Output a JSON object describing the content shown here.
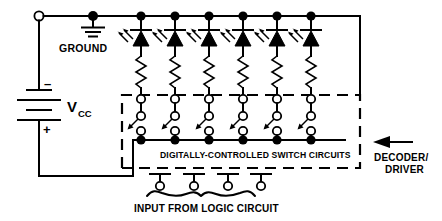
{
  "diagram": {
    "type": "schematic",
    "labels": {
      "ground": "GROUND",
      "vcc": "V",
      "vcc_subscript": "CC",
      "battery_minus": "–",
      "battery_plus": "+",
      "switch_block": "DIGITALLY-CONTROLLED SWITCH CIRCUITS",
      "input_block": "INPUT FROM LOGIC CIRCUIT",
      "decoder_line1": "DECODER/",
      "decoder_line2": "DRIVER"
    },
    "colors": {
      "ink": "#000000",
      "background": "#ffffff"
    },
    "counts": {
      "led_branches": 6,
      "logic_input_terminals": 4,
      "top_rail_nodes": 6,
      "bottom_rail_nodes": 6
    },
    "components": {
      "led": "light-emitting-diode",
      "resistor": "zigzag-resistor",
      "switch": "single-pole-switch",
      "battery": "dc-voltage-source",
      "ground": "earth-ground-symbol"
    },
    "annotations": {
      "decoder_arrow": "arrow-pointing-left-to-switch-block"
    }
  }
}
